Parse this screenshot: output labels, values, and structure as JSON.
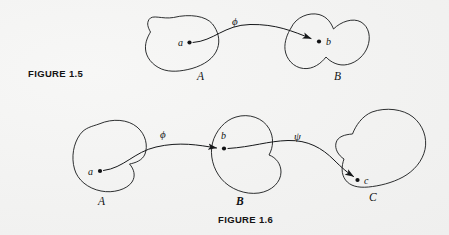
{
  "page": {
    "background_color": "#f4f4f3",
    "ink_color": "#16181a"
  },
  "figures": [
    {
      "id": "figure-1-5",
      "caption": "FIGURE 1.5",
      "sets": [
        {
          "name": "A",
          "label": "A"
        },
        {
          "name": "B",
          "label": "B"
        }
      ],
      "elements": [
        {
          "name": "a",
          "label": "a",
          "in_set": "A"
        },
        {
          "name": "b",
          "label": "b",
          "in_set": "B"
        }
      ],
      "maps": [
        {
          "name": "phi",
          "label": "ϕ",
          "from": "A",
          "to": "B"
        }
      ]
    },
    {
      "id": "figure-1-6",
      "caption": "FIGURE 1.6",
      "sets": [
        {
          "name": "A",
          "label": "A"
        },
        {
          "name": "B",
          "label": "B"
        },
        {
          "name": "C",
          "label": "C"
        }
      ],
      "elements": [
        {
          "name": "a",
          "label": "a",
          "in_set": "A"
        },
        {
          "name": "b",
          "label": "b",
          "in_set": "B"
        },
        {
          "name": "c",
          "label": "c",
          "in_set": "C"
        }
      ],
      "maps": [
        {
          "name": "phi",
          "label": "ϕ",
          "from": "A",
          "to": "B"
        },
        {
          "name": "psi",
          "label": "ψ",
          "from": "B",
          "to": "C"
        }
      ]
    }
  ],
  "captions": {
    "figure_1_5": "FIGURE 1.5",
    "figure_1_6": "FIGURE 1.6"
  },
  "labels": {
    "fig15_set_a": "A",
    "fig15_set_b": "B",
    "fig15_elem_a": "a",
    "fig15_elem_b": "b",
    "fig15_map_phi": "ϕ",
    "fig16_set_a": "A",
    "fig16_set_b": "B",
    "fig16_set_c": "C",
    "fig16_elem_a": "a",
    "fig16_elem_b": "b",
    "fig16_elem_c": "c",
    "fig16_map_phi": "ϕ",
    "fig16_map_psi": "ψ"
  }
}
